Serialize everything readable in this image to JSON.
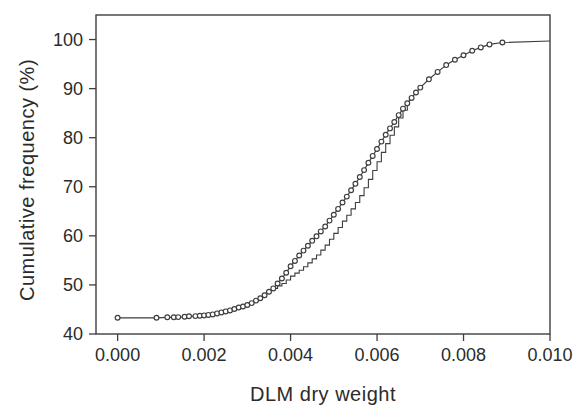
{
  "figure": {
    "background": "#ffffff",
    "ink_color": "#3e3e3e",
    "text_color": "#2b2b2b"
  },
  "chart_data": {
    "type": "line",
    "title": "",
    "xlabel": "DLM dry weight",
    "ylabel": "Cumulative frequency (%)",
    "xlim": [
      -0.0005,
      0.01
    ],
    "ylim": [
      40,
      105
    ],
    "grid": false,
    "legend_position": "none",
    "x_ticks": [
      0.0,
      0.002,
      0.004,
      0.006,
      0.008,
      0.01
    ],
    "x_tick_labels": [
      "0.000",
      "0.002",
      "0.004",
      "0.006",
      "0.008",
      "0.010"
    ],
    "y_ticks": [
      40,
      50,
      60,
      70,
      80,
      90,
      100
    ],
    "y_tick_labels": [
      "40",
      "50",
      "60",
      "70",
      "80",
      "90",
      "100"
    ],
    "series": [
      {
        "name": "cumulative-frequency-curve",
        "marker": "open-circle",
        "line": "solid",
        "points": [
          [
            0.0,
            43.3
          ],
          [
            0.0009,
            43.3
          ],
          [
            0.00115,
            43.4
          ],
          [
            0.0013,
            43.4
          ],
          [
            0.0014,
            43.45
          ],
          [
            0.00155,
            43.5
          ],
          [
            0.00165,
            43.6
          ],
          [
            0.0018,
            43.65
          ],
          [
            0.0019,
            43.7
          ],
          [
            0.002,
            43.8
          ],
          [
            0.0021,
            43.9
          ],
          [
            0.0022,
            44.0
          ],
          [
            0.0023,
            44.2
          ],
          [
            0.0024,
            44.4
          ],
          [
            0.0025,
            44.6
          ],
          [
            0.0026,
            44.8
          ],
          [
            0.0027,
            45.1
          ],
          [
            0.0028,
            45.4
          ],
          [
            0.0029,
            45.6
          ],
          [
            0.003,
            45.9
          ],
          [
            0.0031,
            46.3
          ],
          [
            0.0032,
            46.8
          ],
          [
            0.0033,
            47.3
          ],
          [
            0.0034,
            47.9
          ],
          [
            0.0035,
            48.6
          ],
          [
            0.0036,
            49.3
          ],
          [
            0.0037,
            50.3
          ],
          [
            0.0038,
            51.3
          ],
          [
            0.0039,
            52.5
          ],
          [
            0.004,
            53.8
          ],
          [
            0.0041,
            54.9
          ],
          [
            0.0042,
            56.0
          ],
          [
            0.0043,
            57.0
          ],
          [
            0.0044,
            58.0
          ],
          [
            0.0045,
            59.0
          ],
          [
            0.0046,
            59.9
          ],
          [
            0.0047,
            60.9
          ],
          [
            0.0048,
            61.9
          ],
          [
            0.0049,
            63.1
          ],
          [
            0.005,
            64.3
          ],
          [
            0.0051,
            65.5
          ],
          [
            0.0052,
            66.8
          ],
          [
            0.0053,
            68.0
          ],
          [
            0.0054,
            69.3
          ],
          [
            0.0055,
            70.6
          ],
          [
            0.0056,
            72.0
          ],
          [
            0.0057,
            73.4
          ],
          [
            0.0058,
            74.9
          ],
          [
            0.0059,
            76.3
          ],
          [
            0.006,
            77.7
          ],
          [
            0.0061,
            79.2
          ],
          [
            0.0062,
            80.6
          ],
          [
            0.0063,
            81.9
          ],
          [
            0.0064,
            83.2
          ],
          [
            0.0065,
            84.6
          ],
          [
            0.0066,
            85.9
          ],
          [
            0.0067,
            87.0
          ],
          [
            0.0068,
            88.1
          ],
          [
            0.0069,
            89.2
          ],
          [
            0.007,
            90.2
          ],
          [
            0.0072,
            91.9
          ],
          [
            0.0074,
            93.4
          ],
          [
            0.0076,
            94.8
          ],
          [
            0.0078,
            95.9
          ],
          [
            0.008,
            96.8
          ],
          [
            0.0082,
            97.7
          ],
          [
            0.0084,
            98.4
          ],
          [
            0.0086,
            99.0
          ],
          [
            0.0089,
            99.4
          ]
        ],
        "line_extension": [
          [
            0.01,
            99.7
          ]
        ]
      },
      {
        "name": "empirical-step-line",
        "marker": "none",
        "line": "step",
        "points": [
          [
            0.0036,
            49.3
          ],
          [
            0.0037,
            49.8
          ],
          [
            0.0038,
            50.3
          ],
          [
            0.0039,
            51.0
          ],
          [
            0.004,
            51.8
          ],
          [
            0.0041,
            52.4
          ],
          [
            0.0042,
            53.0
          ],
          [
            0.0043,
            53.7
          ],
          [
            0.0044,
            54.5
          ],
          [
            0.0045,
            55.3
          ],
          [
            0.0046,
            56.1
          ],
          [
            0.0047,
            57.1
          ],
          [
            0.0048,
            58.1
          ],
          [
            0.0049,
            59.3
          ],
          [
            0.005,
            60.5
          ],
          [
            0.0051,
            61.7
          ],
          [
            0.0052,
            63.0
          ],
          [
            0.0053,
            64.2
          ],
          [
            0.0054,
            65.5
          ],
          [
            0.0055,
            66.8
          ],
          [
            0.0056,
            68.2
          ],
          [
            0.0057,
            69.8
          ],
          [
            0.0058,
            71.5
          ],
          [
            0.0059,
            73.3
          ],
          [
            0.006,
            75.1
          ],
          [
            0.0061,
            77.0
          ],
          [
            0.0062,
            78.8
          ],
          [
            0.0063,
            80.5
          ],
          [
            0.0064,
            82.2
          ],
          [
            0.0065,
            84.0
          ],
          [
            0.0066,
            85.6
          ],
          [
            0.0067,
            87.0
          ]
        ]
      }
    ]
  }
}
